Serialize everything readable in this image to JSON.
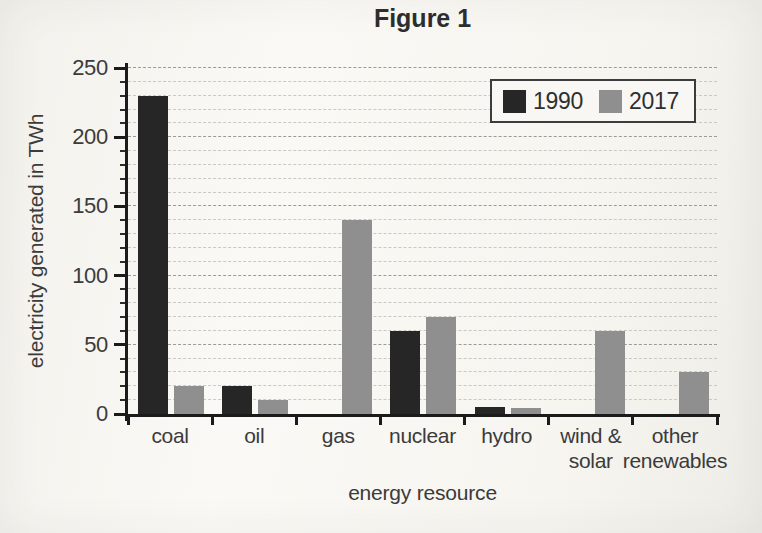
{
  "chart_data": {
    "type": "bar",
    "title": "Figure 1",
    "xlabel": "energy resource",
    "ylabel": "electricity generated in TWh",
    "categories": [
      {
        "lines": [
          "coal"
        ]
      },
      {
        "lines": [
          "oil"
        ]
      },
      {
        "lines": [
          "gas"
        ]
      },
      {
        "lines": [
          "nuclear"
        ]
      },
      {
        "lines": [
          "hydro"
        ]
      },
      {
        "lines": [
          "wind &",
          "solar"
        ]
      },
      {
        "lines": [
          "other",
          "renewables"
        ]
      }
    ],
    "series": [
      {
        "name": "1990",
        "color": "#262626",
        "values": [
          230,
          20,
          0,
          60,
          5,
          0,
          0
        ]
      },
      {
        "name": "2017",
        "color": "#8f8f8f",
        "values": [
          20,
          10,
          140,
          70,
          4,
          60,
          30
        ]
      }
    ],
    "ylim": [
      0,
      250
    ],
    "yticks": [
      0,
      50,
      100,
      150,
      200,
      250
    ],
    "ytick_interval": 50,
    "minor_gridline_interval": 10,
    "grid": true,
    "legend_position": "top-right",
    "unit": "TWh"
  }
}
